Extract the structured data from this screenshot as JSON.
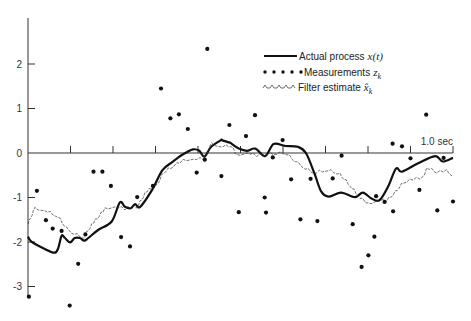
{
  "chart_data": {
    "type": "line",
    "title": "",
    "xlabel": "",
    "ylabel": "",
    "x_end_label": "1.0 sec",
    "xlim": [
      0,
      1.0
    ],
    "ylim": [
      -3.2,
      3.0
    ],
    "x_ticks": [
      0.1,
      0.2,
      0.3,
      0.4,
      0.5,
      0.6,
      0.7,
      0.8,
      0.9,
      1.0
    ],
    "y_ticks": [
      2,
      1,
      0,
      -1,
      -2,
      -3
    ],
    "y_tick_labels": [
      "2",
      "1",
      "0",
      "-1",
      "-2",
      "-3"
    ],
    "grid": false,
    "legend_position": "upper right",
    "legend": [
      {
        "style": "solid",
        "label": "Actual process",
        "symbol": "x(t)"
      },
      {
        "style": "dots",
        "label": "Measurements",
        "symbol": "z",
        "subscript": "k"
      },
      {
        "style": "dashed-caret",
        "label": "Filter estimate",
        "symbol": "x̂",
        "subscript": "k"
      }
    ],
    "series": [
      {
        "name": "Actual process x(t)",
        "style": "solid",
        "points": [
          [
            0.0,
            -1.88
          ],
          [
            0.008,
            -1.99
          ],
          [
            0.036,
            -2.14
          ],
          [
            0.062,
            -2.24
          ],
          [
            0.071,
            -2.14
          ],
          [
            0.079,
            -1.86
          ],
          [
            0.087,
            -1.91
          ],
          [
            0.099,
            -2.01
          ],
          [
            0.11,
            -1.91
          ],
          [
            0.122,
            -1.91
          ],
          [
            0.132,
            -1.97
          ],
          [
            0.142,
            -1.91
          ],
          [
            0.165,
            -1.73
          ],
          [
            0.197,
            -1.54
          ],
          [
            0.216,
            -1.11
          ],
          [
            0.228,
            -1.21
          ],
          [
            0.242,
            -1.24
          ],
          [
            0.252,
            -1.15
          ],
          [
            0.264,
            -1.21
          ],
          [
            0.292,
            -0.83
          ],
          [
            0.316,
            -0.39
          ],
          [
            0.34,
            -0.2
          ],
          [
            0.363,
            -0.04
          ],
          [
            0.388,
            0.08
          ],
          [
            0.403,
            0.05
          ],
          [
            0.415,
            -0.08
          ],
          [
            0.431,
            0.14
          ],
          [
            0.454,
            0.29
          ],
          [
            0.456,
            0.29
          ],
          [
            0.476,
            0.23
          ],
          [
            0.475,
            0.23
          ],
          [
            0.496,
            0.1
          ],
          [
            0.515,
            0.05
          ],
          [
            0.535,
            0.1
          ],
          [
            0.558,
            -0.07
          ],
          [
            0.578,
            0.2
          ],
          [
            0.605,
            0.16
          ],
          [
            0.635,
            0.14
          ],
          [
            0.654,
            0.0
          ],
          [
            0.674,
            -0.46
          ],
          [
            0.69,
            -0.87
          ],
          [
            0.708,
            -0.98
          ],
          [
            0.737,
            -0.89
          ],
          [
            0.769,
            -0.99
          ],
          [
            0.788,
            -0.89
          ],
          [
            0.808,
            -1.02
          ],
          [
            0.827,
            -1.06
          ],
          [
            0.847,
            -0.76
          ],
          [
            0.866,
            -0.35
          ],
          [
            0.88,
            -0.42
          ],
          [
            0.918,
            -0.23
          ],
          [
            0.958,
            -0.07
          ],
          [
            0.976,
            -0.19
          ],
          [
            1.0,
            -0.11
          ]
        ]
      },
      {
        "name": "Measurements z_k",
        "style": "dots",
        "points": [
          [
            0.002,
            -3.23
          ],
          [
            0.021,
            -0.85
          ],
          [
            0.042,
            -1.51
          ],
          [
            0.058,
            -1.7
          ],
          [
            0.079,
            -1.75
          ],
          [
            0.118,
            -2.49
          ],
          [
            0.098,
            -3.43
          ],
          [
            0.135,
            -1.83
          ],
          [
            0.154,
            -0.42
          ],
          [
            0.175,
            -0.42
          ],
          [
            0.195,
            -0.74
          ],
          [
            0.219,
            -1.89
          ],
          [
            0.24,
            -2.1
          ],
          [
            0.257,
            -0.99
          ],
          [
            0.294,
            -0.74
          ],
          [
            0.313,
            1.45
          ],
          [
            0.335,
            0.78
          ],
          [
            0.355,
            0.87
          ],
          [
            0.376,
            0.54
          ],
          [
            0.397,
            -0.44
          ],
          [
            0.416,
            -0.15
          ],
          [
            0.422,
            2.34
          ],
          [
            0.455,
            -0.52
          ],
          [
            0.474,
            0.63
          ],
          [
            0.496,
            -1.33
          ],
          [
            0.513,
            0.38
          ],
          [
            0.534,
            0.85
          ],
          [
            0.557,
            -1.0
          ],
          [
            0.576,
            -0.1
          ],
          [
            0.56,
            -1.34
          ],
          [
            0.599,
            0.29
          ],
          [
            0.619,
            -0.59
          ],
          [
            0.641,
            -1.49
          ],
          [
            0.665,
            -0.58
          ],
          [
            0.681,
            -1.53
          ],
          [
            0.717,
            -0.57
          ],
          [
            0.738,
            -0.06
          ],
          [
            0.764,
            -1.6
          ],
          [
            0.785,
            -2.56
          ],
          [
            0.801,
            -2.3
          ],
          [
            0.815,
            -1.88
          ],
          [
            0.819,
            -0.97
          ],
          [
            0.839,
            -1.1
          ],
          [
            0.859,
            -1.31
          ],
          [
            0.858,
            0.21
          ],
          [
            0.88,
            0.15
          ],
          [
            0.9,
            -0.12
          ],
          [
            0.921,
            -0.83
          ],
          [
            0.937,
            0.86
          ],
          [
            0.963,
            -1.29
          ],
          [
            0.978,
            -0.11
          ],
          [
            1.0,
            -1.09
          ]
        ]
      },
      {
        "name": "Filter estimate x̂_k",
        "style": "dashed-caret",
        "points": [
          [
            0.0,
            -1.6
          ],
          [
            0.016,
            -1.27
          ],
          [
            0.04,
            -1.3
          ],
          [
            0.071,
            -1.45
          ],
          [
            0.095,
            -1.77
          ],
          [
            0.13,
            -1.92
          ],
          [
            0.154,
            -1.58
          ],
          [
            0.181,
            -1.28
          ],
          [
            0.205,
            -1.21
          ],
          [
            0.228,
            -1.28
          ],
          [
            0.248,
            -1.21
          ],
          [
            0.256,
            -1.24
          ],
          [
            0.279,
            -0.88
          ],
          [
            0.303,
            -0.75
          ],
          [
            0.318,
            -0.46
          ],
          [
            0.342,
            -0.31
          ],
          [
            0.365,
            -0.19
          ],
          [
            0.389,
            -0.14
          ],
          [
            0.413,
            -0.16
          ],
          [
            0.432,
            0.18
          ],
          [
            0.452,
            0.14
          ],
          [
            0.479,
            0.14
          ],
          [
            0.491,
            -0.08
          ],
          [
            0.515,
            0.0
          ],
          [
            0.538,
            -0.08
          ],
          [
            0.569,
            -0.04
          ],
          [
            0.601,
            -0.02
          ],
          [
            0.609,
            -0.04
          ],
          [
            0.64,
            -0.3
          ],
          [
            0.672,
            -0.46
          ],
          [
            0.706,
            -0.4
          ],
          [
            0.734,
            -0.5
          ],
          [
            0.758,
            -0.75
          ],
          [
            0.781,
            -1.02
          ],
          [
            0.801,
            -1.17
          ],
          [
            0.82,
            -1.08
          ],
          [
            0.844,
            -1.09
          ],
          [
            0.864,
            -0.9
          ],
          [
            0.883,
            -0.68
          ],
          [
            0.906,
            -0.61
          ],
          [
            0.93,
            -0.57
          ],
          [
            0.938,
            -0.34
          ],
          [
            0.962,
            -0.45
          ],
          [
            0.985,
            -0.42
          ],
          [
            1.0,
            -0.53
          ]
        ]
      }
    ]
  },
  "layout": {
    "origin_x": 28,
    "x_per_unit": 425,
    "zero_y": 153,
    "y_per_unit": 44.5,
    "axis_top": 18,
    "axis_bottom": 297
  }
}
